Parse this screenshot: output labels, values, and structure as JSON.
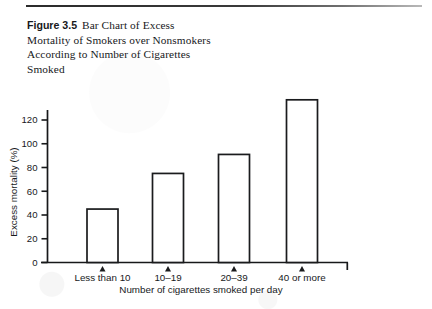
{
  "figure": {
    "number_label": "Figure 3.5",
    "caption": "Bar Chart of Excess Mortality of Smokers over Nonsmokers According to Number of Cigarettes Smoked"
  },
  "chart_data": {
    "type": "bar",
    "title": "",
    "categories": [
      "Less than 10",
      "10–19",
      "20–39",
      "40 or more"
    ],
    "values": [
      45,
      75,
      91,
      137
    ],
    "xlabel": "Number of cigarettes smoked per day",
    "ylabel": "Excess mortality (%)",
    "ylim": [
      0,
      140
    ],
    "yticks": [
      0,
      20,
      40,
      60,
      80,
      100,
      120
    ],
    "ytick_labels": [
      "0",
      "20",
      "40",
      "60",
      "80",
      "100",
      "120"
    ],
    "grid": false,
    "legend": false,
    "bar_fill": "#ffffff",
    "bar_stroke": "#1a1b1d",
    "axis_color": "#17181a"
  }
}
